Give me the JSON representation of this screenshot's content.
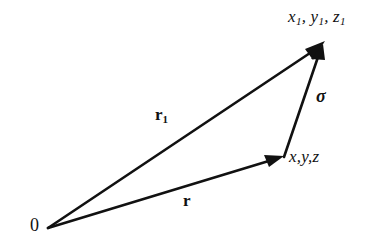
{
  "figure": {
    "background_color": "#ffffff",
    "stroke_color": "#111111",
    "origin": {
      "name": "origin-label",
      "text": "0"
    },
    "points": [
      {
        "id": "point-1",
        "name": "coordinate-label-x1y1z1",
        "text_parts": [
          "x",
          "1",
          ", y",
          "1",
          ", z",
          "1"
        ],
        "full_text": "x1, y1, z1",
        "x": 324,
        "y": 43
      },
      {
        "id": "point-0",
        "name": "coordinate-label-xyz",
        "full_text": "x,y,z",
        "x": 283,
        "y": 157
      }
    ],
    "vectors": [
      {
        "id": "vector-r1",
        "label": "r",
        "subscript": "1",
        "from": [
          48,
          228
        ],
        "to": [
          324,
          43
        ],
        "style": "bold-italic-serif"
      },
      {
        "id": "vector-r",
        "label": "r",
        "subscript": "",
        "from": [
          48,
          228
        ],
        "to": [
          283,
          157
        ],
        "style": "bold-italic-serif"
      },
      {
        "id": "vector-sigma",
        "label": "σ",
        "subscript": "",
        "from": [
          284,
          156
        ],
        "to": [
          323,
          47
        ],
        "style": "bold-italic-serif"
      }
    ]
  }
}
